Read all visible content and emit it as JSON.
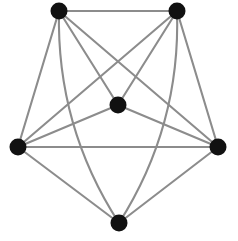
{
  "figure": {
    "width": 238,
    "height": 241,
    "background_color": "#ffffff"
  },
  "style": {
    "edge_color": "#8c8c8c",
    "edge_width": 2.1,
    "vertex_color": "#111111",
    "vertex_radius": 8.5
  },
  "chart_data": {
    "type": "graph",
    "vertex_count": 6,
    "edge_count": 14,
    "vertices": [
      {
        "id": "top-left",
        "label": "",
        "x": 59,
        "y": 11
      },
      {
        "id": "top-right",
        "label": "",
        "x": 177,
        "y": 11
      },
      {
        "id": "center",
        "label": "",
        "x": 118,
        "y": 105
      },
      {
        "id": "left",
        "label": "",
        "x": 18,
        "y": 147
      },
      {
        "id": "right",
        "label": "",
        "x": 218,
        "y": 147
      },
      {
        "id": "bottom",
        "label": "",
        "x": 119,
        "y": 223
      }
    ],
    "edges": [
      {
        "from": "top-left",
        "to": "top-right",
        "curve": 0
      },
      {
        "from": "top-left",
        "to": "center",
        "curve": 0
      },
      {
        "from": "top-left",
        "to": "left",
        "curve": 0
      },
      {
        "from": "top-left",
        "to": "right",
        "curve": 0
      },
      {
        "from": "top-left",
        "to": "bottom",
        "curve": 34
      },
      {
        "from": "top-right",
        "to": "center",
        "curve": 0
      },
      {
        "from": "top-right",
        "to": "left",
        "curve": 0
      },
      {
        "from": "top-right",
        "to": "right",
        "curve": 0
      },
      {
        "from": "top-right",
        "to": "bottom",
        "curve": -34
      },
      {
        "from": "center",
        "to": "left",
        "curve": 0
      },
      {
        "from": "center",
        "to": "right",
        "curve": 0
      },
      {
        "from": "left",
        "to": "right",
        "curve": 0
      },
      {
        "from": "left",
        "to": "bottom",
        "curve": 0
      },
      {
        "from": "right",
        "to": "bottom",
        "curve": 0
      }
    ]
  }
}
